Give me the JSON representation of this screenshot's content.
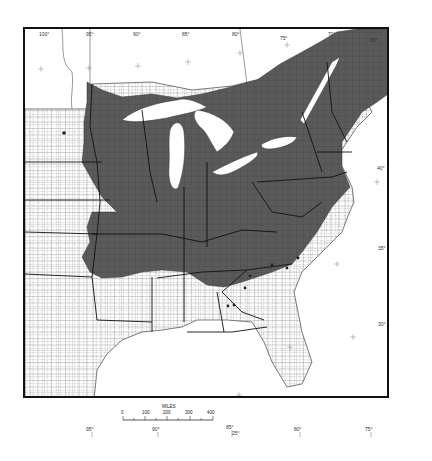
{
  "map": {
    "subject": "Eastern United States county map with shaded distribution range",
    "colors": {
      "shaded_range": "#5a5a5a",
      "land": "#ffffff",
      "water": "#ffffff",
      "county_lines": "#555555",
      "state_lines": "#111111",
      "frame": "#111111"
    },
    "top_longitude_labels": [
      "100°",
      "95°",
      "90°",
      "85°",
      "80°",
      "75°",
      "70°",
      "65°"
    ],
    "right_latitude_labels": [
      "45°",
      "40°",
      "35°",
      "30°",
      "25°"
    ],
    "bottom_longitude_labels": [
      "95°",
      "90°",
      "85°",
      "80°",
      "75°"
    ],
    "bottom_latitude_label": "25°",
    "scale_bar": {
      "title": "MILES",
      "ticks": [
        "0",
        "100",
        "200",
        "300",
        "400"
      ]
    },
    "outlier_dots_count": 8
  }
}
